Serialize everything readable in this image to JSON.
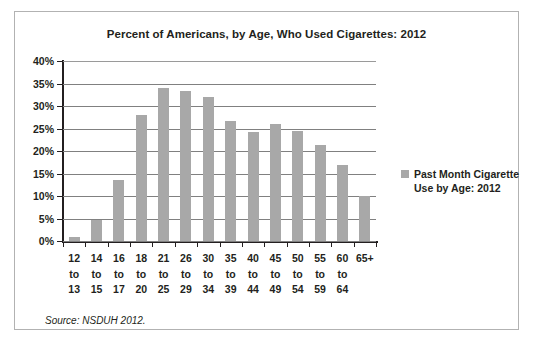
{
  "chart_data": {
    "type": "bar",
    "title": "Percent of Americans, by Age, Who Used Cigarettes: 2012",
    "xlabel": "",
    "ylabel": "",
    "ylim": [
      0,
      40
    ],
    "grid": true,
    "legend_position": "right",
    "bar_color": "#a8a8a8",
    "categories": [
      "12 to 13",
      "14 to 15",
      "16 to 17",
      "18 to 20",
      "21 to 25",
      "26 to 29",
      "30 to 34",
      "35 to 39",
      "40 to 44",
      "45 to 49",
      "50 to 54",
      "55 to 59",
      "60 to 64",
      "65+"
    ],
    "category_lines": [
      [
        "12",
        "to",
        "13"
      ],
      [
        "14",
        "to",
        "15"
      ],
      [
        "16",
        "to",
        "17"
      ],
      [
        "18",
        "to",
        "20"
      ],
      [
        "21",
        "to",
        "25"
      ],
      [
        "26",
        "to",
        "29"
      ],
      [
        "30",
        "to",
        "34"
      ],
      [
        "35",
        "to",
        "39"
      ],
      [
        "40",
        "to",
        "44"
      ],
      [
        "45",
        "to",
        "49"
      ],
      [
        "50",
        "to",
        "54"
      ],
      [
        "55",
        "to",
        "59"
      ],
      [
        "60",
        "to",
        "64"
      ],
      [
        "65+",
        "",
        ""
      ]
    ],
    "series": [
      {
        "name": "Past Month Cigarette Use by Age: 2012",
        "values": [
          1.0,
          4.6,
          13.5,
          28.1,
          34.1,
          33.4,
          31.9,
          26.6,
          24.3,
          25.9,
          24.4,
          21.4,
          16.8,
          10.0
        ]
      }
    ],
    "yticks": [
      0,
      5,
      10,
      15,
      20,
      25,
      30,
      35,
      40
    ],
    "ytick_labels": [
      "0%",
      "5%",
      "10%",
      "15%",
      "20%",
      "25%",
      "30%",
      "35%",
      "40%"
    ]
  },
  "legend": {
    "label": "Past Month Cigarette\nUse by Age: 2012",
    "swatch_color": "#a8a8a8"
  },
  "source": {
    "note": "Source: NSDUH 2012."
  }
}
